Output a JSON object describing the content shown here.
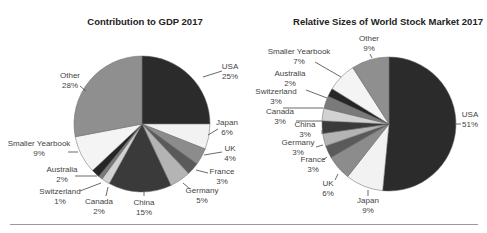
{
  "chart_data": [
    {
      "type": "pie",
      "title": "Contribution to GDP 2017",
      "categories": [
        "USA",
        "Japan",
        "UK",
        "France",
        "Germany",
        "China",
        "Canada",
        "Switzerland",
        "Australia",
        "Smaller Yearbook",
        "Other"
      ],
      "values": [
        25,
        6,
        4,
        3,
        5,
        15,
        2,
        1,
        2,
        9,
        28
      ],
      "labels": [
        "25%",
        "6%",
        "4%",
        "3%",
        "5%",
        "15%",
        "2%",
        "1%",
        "2%",
        "9%",
        "28%"
      ],
      "colors": [
        "#2b2b2b",
        "#f2f2f2",
        "#8c8c8c",
        "#5a5a5a",
        "#b4b4b4",
        "#3a3a3a",
        "#d2d2d2",
        "#7a7a7a",
        "#262626",
        "#f4f4f4",
        "#8f8f8f"
      ],
      "start_angle": "top, clockwise",
      "center": [
        142,
        124
      ],
      "radius": 68,
      "label_positions": [
        {
          "x": 230,
          "y": 69,
          "anchor": "middle",
          "lx1": 203,
          "ly1": 77,
          "lx2": 222,
          "ly2": 71
        },
        {
          "x": 227,
          "y": 125,
          "anchor": "middle",
          "lx1": 208,
          "ly1": 135,
          "lx2": 218,
          "ly2": 129
        },
        {
          "x": 230,
          "y": 151,
          "anchor": "middle",
          "lx1": 204,
          "ly1": 155,
          "lx2": 222,
          "ly2": 152
        },
        {
          "x": 222,
          "y": 174,
          "anchor": "middle",
          "lx1": 196,
          "ly1": 170,
          "lx2": 208,
          "ly2": 173
        },
        {
          "x": 202,
          "y": 193,
          "anchor": "middle",
          "lx1": 183,
          "ly1": 183,
          "lx2": 190,
          "ly2": 189
        },
        {
          "x": 144,
          "y": 205,
          "anchor": "middle",
          "lx1": 144,
          "ly1": 192,
          "lx2": 144,
          "ly2": 196
        },
        {
          "x": 99,
          "y": 204,
          "anchor": "middle",
          "lx1": 108,
          "ly1": 187,
          "lx2": 106,
          "ly2": 196
        },
        {
          "x": 60,
          "y": 194,
          "anchor": "middle",
          "lx1": 101,
          "ly1": 183,
          "lx2": 80,
          "ly2": 191
        },
        {
          "x": 62,
          "y": 172,
          "anchor": "middle",
          "lx1": 97,
          "ly1": 176,
          "lx2": 75,
          "ly2": 176
        },
        {
          "x": 39,
          "y": 146,
          "anchor": "middle",
          "lx1": 78,
          "ly1": 152,
          "lx2": 68,
          "ly2": 152
        },
        {
          "x": 70,
          "y": 78,
          "anchor": "middle",
          "lx1": 86,
          "ly1": 91,
          "lx2": 80,
          "ly2": 86
        }
      ]
    },
    {
      "type": "pie",
      "title": "Relative Sizes of World Stock Market 2017",
      "categories": [
        "USA",
        "Japan",
        "UK",
        "France",
        "Germany",
        "China",
        "Canada",
        "Switzerland",
        "Australia",
        "Smaller Yearbook",
        "Other"
      ],
      "values": [
        51,
        9,
        6,
        3,
        3,
        3,
        3,
        3,
        2,
        7,
        9
      ],
      "labels": [
        "51%",
        "9%",
        "6%",
        "3%",
        "3%",
        "3%",
        "3%",
        "3%",
        "2%",
        "7%",
        "9%"
      ],
      "colors": [
        "#2b2b2b",
        "#f2f2f2",
        "#8c8c8c",
        "#5a5a5a",
        "#b4b4b4",
        "#3a3a3a",
        "#d2d2d2",
        "#7a7a7a",
        "#262626",
        "#f4f4f4",
        "#8f8f8f"
      ],
      "start_angle": "top, clockwise",
      "center": [
        389,
        124
      ],
      "radius": 67,
      "label_positions": [
        {
          "x": 470,
          "y": 117,
          "anchor": "middle",
          "lx1": 456,
          "ly1": 124,
          "lx2": 461,
          "ly2": 124
        },
        {
          "x": 368,
          "y": 203,
          "anchor": "middle",
          "lx1": 368,
          "ly1": 190,
          "lx2": 368,
          "ly2": 196
        },
        {
          "x": 328,
          "y": 186,
          "anchor": "middle",
          "lx1": 338,
          "ly1": 174,
          "lx2": 335,
          "ly2": 180
        },
        {
          "x": 313,
          "y": 162,
          "anchor": "middle",
          "lx1": 327,
          "ly1": 157,
          "lx2": 323,
          "ly2": 160
        },
        {
          "x": 298,
          "y": 145,
          "anchor": "middle",
          "lx1": 323,
          "ly1": 145,
          "lx2": 316,
          "ly2": 147
        },
        {
          "x": 305,
          "y": 127,
          "anchor": "middle",
          "lx1": 322,
          "ly1": 134,
          "lx2": 322,
          "ly2": 130
        },
        {
          "x": 280,
          "y": 114,
          "anchor": "middle",
          "lx1": 322,
          "ly1": 121,
          "lx2": 296,
          "ly2": 121
        },
        {
          "x": 276,
          "y": 94,
          "anchor": "middle",
          "lx1": 323,
          "ly1": 108,
          "lx2": 283,
          "ly2": 108
        },
        {
          "x": 290,
          "y": 76,
          "anchor": "middle",
          "lx1": 327,
          "ly1": 98,
          "lx2": 306,
          "ly2": 90
        },
        {
          "x": 299,
          "y": 54,
          "anchor": "middle",
          "lx1": 341,
          "ly1": 77,
          "lx2": 315,
          "ly2": 62
        },
        {
          "x": 369,
          "y": 41,
          "anchor": "middle",
          "lx1": 372,
          "ly1": 58,
          "lx2": 370,
          "ly2": 54
        }
      ]
    }
  ],
  "page": {
    "title_left": "Contribution to GDP 2017",
    "title_right": "Relative Sizes of World Stock Market 2017"
  }
}
